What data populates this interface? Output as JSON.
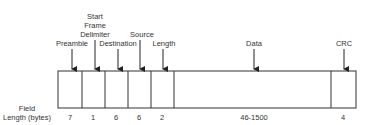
{
  "diagram": {
    "row_label": {
      "line1": "Field",
      "line2": "Length (bytes)"
    },
    "fields": [
      {
        "name": "Preamble",
        "length": "7"
      },
      {
        "name": "Start Frame Delimiter",
        "name_lines": [
          "Start",
          "Frame",
          "Delimiter"
        ],
        "length": "1"
      },
      {
        "name": "Destination",
        "length": "6"
      },
      {
        "name": "Source",
        "length": "6"
      },
      {
        "name": "Length",
        "length": "2"
      },
      {
        "name": "Data",
        "length": "46-1500"
      },
      {
        "name": "CRC",
        "length": "4"
      }
    ]
  }
}
